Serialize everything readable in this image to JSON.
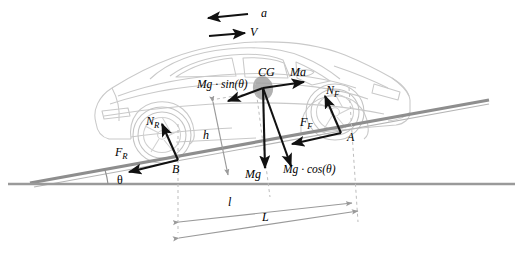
{
  "diagram": {
    "background_color": "#ffffff",
    "vehicle": {
      "name": "sports-coupe-outline",
      "stroke_color": "#c9c9c9",
      "cg_marker_color": "#9a9a9a"
    },
    "surfaces": {
      "incline_color": "#8e8e8e",
      "ground_color": "#9a9a9a",
      "dashed_color": "#b9b9b9"
    },
    "vector_color": "#111111"
  },
  "labels": {
    "acceleration": "a",
    "velocity": "V",
    "cg": "CG",
    "inertial_force": "Ma",
    "weight_component_along": "Mg · sin(θ)",
    "weight_component_normal": "Mg · cos(θ)",
    "weight": "Mg",
    "normal_front": "N",
    "normal_front_sub": "F",
    "normal_rear": "N",
    "normal_rear_sub": "R",
    "friction_front": "F",
    "friction_front_sub": "F",
    "friction_rear": "F",
    "friction_rear_sub": "R",
    "contact_front": "A",
    "contact_rear": "B",
    "height": "h",
    "incline_angle": "θ",
    "distance_short": "l",
    "distance_long": "L"
  },
  "geometry": {
    "incline_angle_deg": 9.5,
    "cg_point": [
      263,
      88
    ],
    "front_contact_point": [
      341,
      133
    ],
    "rear_contact_point": [
      178,
      160
    ],
    "ground_y": 184
  }
}
